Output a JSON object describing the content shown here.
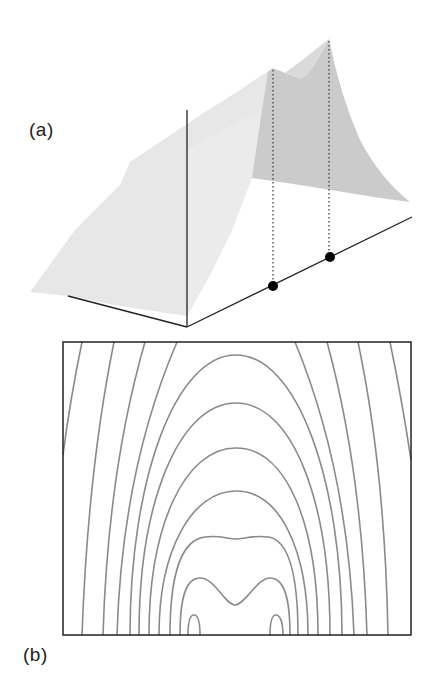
{
  "figure": {
    "panels": [
      {
        "id": "a",
        "label": "(a)",
        "description": "3D surface plot with two peaks projected onto a baseline axis"
      },
      {
        "id": "b",
        "label": "(b)",
        "description": "Contour map of the same surface"
      }
    ]
  },
  "panel_a": {
    "label": "(a)",
    "colors": {
      "surface_light": "#e6e6e6",
      "surface_dark": "#c8c8c8",
      "axis": "#222222",
      "marker": "#000000"
    },
    "peaks": [
      {
        "name": "left-peak",
        "relative_height": "lower"
      },
      {
        "name": "right-peak",
        "relative_height": "higher"
      }
    ],
    "markers_on_axis": 2
  },
  "panel_b": {
    "label": "(b)",
    "colors": {
      "contour": "#8a8a8a",
      "frame": "#222222"
    },
    "open_contour_lines_left": 9,
    "open_contour_lines_right": 9,
    "closed_arches": 6,
    "closed_loops_bottom": 2
  }
}
